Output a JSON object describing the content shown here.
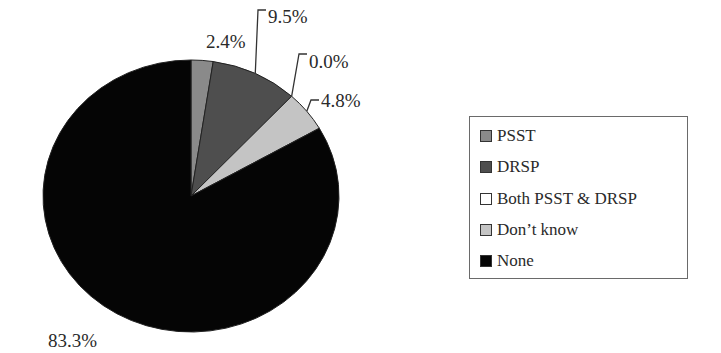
{
  "chart_data": {
    "type": "pie",
    "title": "",
    "categories": [
      "PSST",
      "DRSP",
      "Both PSST & DRSP",
      "Don’t know",
      "None"
    ],
    "values": [
      2.4,
      9.5,
      0.0,
      4.8,
      83.3
    ],
    "labels": [
      "2.4%",
      "9.5%",
      "0.0%",
      "4.8%",
      "83.3%"
    ],
    "colors": [
      "#8a8a8a",
      "#4e4e4e",
      "#ffffff",
      "#c4c4c4",
      "#050505"
    ],
    "start_angle": "12 o'clock, clockwise",
    "legend_position": "right"
  },
  "legend": {
    "items": [
      {
        "label": "PSST",
        "color": "#8a8a8a"
      },
      {
        "label": "DRSP",
        "color": "#4e4e4e"
      },
      {
        "label": "Both PSST & DRSP",
        "color": "#ffffff"
      },
      {
        "label": "Don’t know",
        "color": "#c4c4c4"
      },
      {
        "label": "None",
        "color": "#050505"
      }
    ]
  }
}
